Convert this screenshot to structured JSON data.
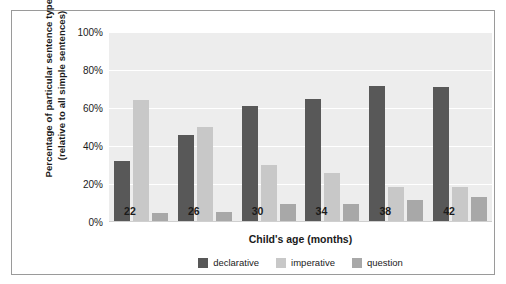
{
  "chart_data": {
    "type": "bar",
    "title": "",
    "xlabel": "Child's age (months)",
    "ylabel_line1": "Percentage of particular sentence types",
    "ylabel_line2": "(relative to all simple sentences)",
    "categories": [
      "22",
      "26",
      "30",
      "34",
      "38",
      "42"
    ],
    "series": [
      {
        "name": "declarative",
        "color": "#585858",
        "values": [
          32,
          46,
          61,
          65,
          71.5,
          71
        ]
      },
      {
        "name": "imperative",
        "color": "#c8c8c8",
        "values": [
          64,
          50,
          30,
          26,
          18.5,
          18.5
        ]
      },
      {
        "name": "question",
        "color": "#a8a8a8",
        "values": [
          5,
          5.5,
          9.5,
          9.5,
          11.5,
          13
        ]
      }
    ],
    "ylim": [
      0,
      100
    ],
    "ytick_labels": [
      "0%",
      "20%",
      "40%",
      "60%",
      "80%",
      "100%"
    ],
    "ytick_values": [
      0,
      20,
      40,
      60,
      80,
      100
    ],
    "grid": true,
    "legend_position": "bottom-center",
    "plot_background": "#ededed",
    "gridline_color": "#ffffff",
    "frame_color": "#9a9a9a"
  }
}
